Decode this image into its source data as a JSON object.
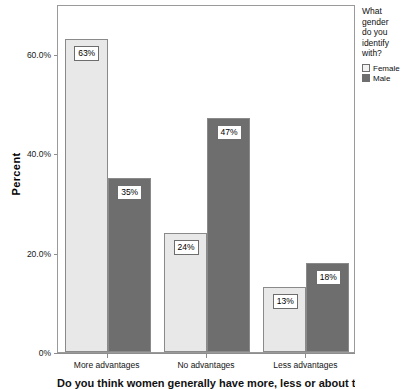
{
  "chart_data": {
    "type": "bar",
    "title": "",
    "subtitle": "",
    "xlabel": "Do you think women generally have more, less or about the same advantages as men?",
    "ylabel": "Percent",
    "categories": [
      "More advantages",
      "No advantages",
      "Less advantages"
    ],
    "series": [
      {
        "name": "Female",
        "color": "#e8e8e8",
        "values": [
          63,
          24,
          13
        ],
        "labels": [
          "63%",
          "24%",
          "13%"
        ]
      },
      {
        "name": "Male",
        "color": "#6e6e6e",
        "values": [
          35,
          47,
          18
        ],
        "labels": [
          "35%",
          "47%",
          "18%"
        ]
      }
    ],
    "ylim": [
      0,
      70
    ],
    "ytick_values": [
      0,
      20,
      40,
      60
    ],
    "ytick_labels": [
      "0%",
      "20.0%",
      "40.0%",
      "60.0%"
    ],
    "grid": false,
    "legend_position": "right",
    "legend": {
      "title_lines": [
        "What",
        "gender",
        "do you",
        "identify",
        "with?"
      ],
      "entries": [
        "Female",
        "Male"
      ]
    }
  },
  "axis": {
    "y_title": "Percent",
    "x_title_visible": "Do you think women generally have more, less or about the same advantages as men?"
  },
  "colors": {
    "female_bar": "#e8e8e8",
    "male_bar": "#6e6e6e",
    "frame": "#9a9a9a",
    "text": "#000000"
  }
}
